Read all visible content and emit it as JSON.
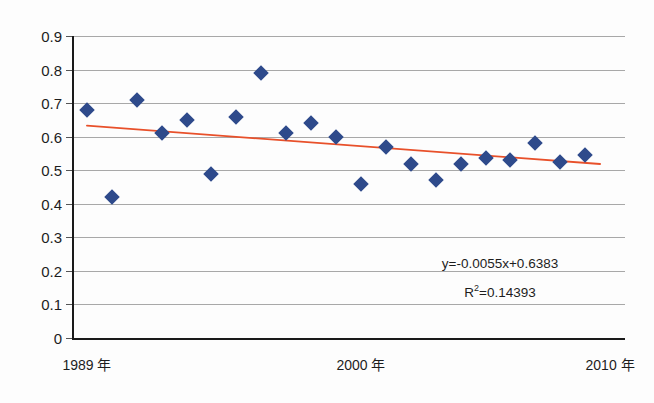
{
  "chart_data": {
    "type": "scatter",
    "title": "",
    "xlabel": "",
    "ylabel": "",
    "ylim": [
      0,
      0.9
    ],
    "xlim": [
      1988.4,
      2010.6
    ],
    "grid": true,
    "legend": false,
    "y_ticks": [
      "0.9",
      "0.8",
      "0.7",
      "0.6",
      "0.5",
      "0.4",
      "0.3",
      "0.2",
      "0.1",
      "0"
    ],
    "y_tick_values": [
      0.9,
      0.8,
      0.7,
      0.6,
      0.5,
      0.4,
      0.3,
      0.2,
      0.1,
      0
    ],
    "x_tick_labels": [
      "1989 年",
      "2000 年",
      "2010 年"
    ],
    "x_tick_values": [
      1989,
      2000,
      2010
    ],
    "x": [
      1989,
      1990,
      1991,
      1992,
      1993,
      1994,
      1995,
      1996,
      1997,
      1998,
      1999,
      2000,
      2001,
      2002,
      2003,
      2004,
      2005,
      2006,
      2007,
      2008,
      2009
    ],
    "values": [
      0.68,
      0.42,
      0.71,
      0.61,
      0.65,
      0.49,
      0.66,
      0.79,
      0.61,
      0.64,
      0.6,
      0.46,
      0.57,
      0.52,
      0.47,
      0.52,
      0.535,
      0.53,
      0.58,
      0.525,
      0.545
    ],
    "series": [
      {
        "name": "data",
        "marker": "diamond",
        "color": "#2e4a8b",
        "points": [
          {
            "x": 1989,
            "y": 0.68
          },
          {
            "x": 1990,
            "y": 0.42
          },
          {
            "x": 1991,
            "y": 0.71
          },
          {
            "x": 1992,
            "y": 0.61
          },
          {
            "x": 1993,
            "y": 0.65
          },
          {
            "x": 1994,
            "y": 0.49
          },
          {
            "x": 1995,
            "y": 0.66
          },
          {
            "x": 1996,
            "y": 0.79
          },
          {
            "x": 1997,
            "y": 0.61
          },
          {
            "x": 1998,
            "y": 0.64
          },
          {
            "x": 1999,
            "y": 0.6
          },
          {
            "x": 2000,
            "y": 0.46
          },
          {
            "x": 2001,
            "y": 0.57
          },
          {
            "x": 2002,
            "y": 0.52
          },
          {
            "x": 2003,
            "y": 0.47
          },
          {
            "x": 2004,
            "y": 0.52
          },
          {
            "x": 2005,
            "y": 0.535
          },
          {
            "x": 2006,
            "y": 0.53
          },
          {
            "x": 2007,
            "y": 0.58
          },
          {
            "x": 2008,
            "y": 0.525
          },
          {
            "x": 2009,
            "y": 0.545
          }
        ]
      }
    ],
    "trendline": {
      "type": "linear",
      "color": "#e8502a",
      "slope": -0.0055,
      "intercept": 0.6383,
      "x_start": 1989,
      "x_end": 2009.6,
      "y_start": 0.6328,
      "y_end": 0.5185
    },
    "annotations": {
      "equation": "y=-0.0055x+0.6383",
      "r_squared_label": "R",
      "r_squared_sup": "2",
      "r_squared_value": "=0.14393"
    }
  },
  "colors": {
    "marker": "#2e4a8b",
    "trendline": "#e8502a",
    "gridline": "#a8a8a8",
    "axis": "#1a1a1a",
    "text": "#1d1d1d",
    "background": "#fdfdfd"
  }
}
